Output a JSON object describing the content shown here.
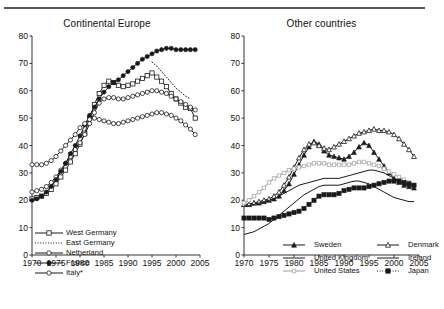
{
  "figure": {
    "panels": [
      {
        "id": "continental-europe",
        "title": "Continental Europe"
      },
      {
        "id": "other-countries",
        "title": "Other countries"
      }
    ]
  },
  "axes": {
    "y_ticks": [
      0,
      10,
      20,
      30,
      40,
      50,
      60,
      70,
      80
    ],
    "x_ticks": [
      1970,
      1975,
      1980,
      1985,
      1990,
      1995,
      2000,
      2005
    ],
    "ylim": [
      0,
      80
    ],
    "xlim": [
      1970,
      2005
    ],
    "grid": false
  },
  "legend_left": {
    "items": [
      {
        "label": "West Germany",
        "marker": "open-square",
        "style": "solid"
      },
      {
        "label": "East Germany",
        "marker": "none",
        "style": "dotted"
      },
      {
        "label": "Netherland",
        "marker": "open-circle",
        "style": "solid"
      },
      {
        "label": "France",
        "marker": "filled-circle",
        "style": "solid"
      },
      {
        "label": "Italy*",
        "marker": "open-circle",
        "style": "solid"
      }
    ]
  },
  "legend_right": {
    "items": [
      {
        "label": "Sweden",
        "marker": "filled-triangle",
        "style": "solid"
      },
      {
        "label": "Denmark",
        "marker": "open-triangle",
        "style": "solid"
      },
      {
        "label": "United Kingdom",
        "marker": "none",
        "style": "solid"
      },
      {
        "label": "Ireland",
        "marker": "none",
        "style": "solid"
      },
      {
        "label": "United States",
        "marker": "open-square-gray",
        "style": "solid-gray"
      },
      {
        "label": "Japan",
        "marker": "filled-square",
        "style": "dotted"
      }
    ]
  },
  "colors": {
    "line": "#1a1a1a",
    "gray_line": "#b3b3b3",
    "axis": "#333333",
    "background": "#ffffff"
  },
  "chart_data": [
    {
      "type": "line",
      "title": "Continental Europe",
      "xlabel": "",
      "ylabel": "",
      "xlim": [
        1970,
        2005
      ],
      "ylim": [
        0,
        80
      ],
      "x": [
        1970,
        1971,
        1972,
        1973,
        1974,
        1975,
        1976,
        1977,
        1978,
        1979,
        1980,
        1981,
        1982,
        1983,
        1984,
        1985,
        1986,
        1987,
        1988,
        1989,
        1990,
        1991,
        1992,
        1993,
        1994,
        1995,
        1996,
        1997,
        1998,
        1999,
        2000,
        2001,
        2002,
        2003,
        2004
      ],
      "series": [
        {
          "name": "West Germany",
          "marker": "open-square",
          "values": [
            20.5,
            21.0,
            21.5,
            22.5,
            24.0,
            26.0,
            28.5,
            31.0,
            34.0,
            37.0,
            40.5,
            44.5,
            50.0,
            55.0,
            59.0,
            62.0,
            63.5,
            63.0,
            62.0,
            61.5,
            62.0,
            62.5,
            63.5,
            64.5,
            65.5,
            66.5,
            65.0,
            63.5,
            61.5,
            59.0,
            57.0,
            55.5,
            54.0,
            53.5,
            50.0
          ]
        },
        {
          "name": "East Germany",
          "marker": "none",
          "style": "dotted",
          "x": [
            1995,
            1996,
            1997,
            1998,
            1999,
            2000,
            2001,
            2002,
            2003
          ],
          "values": [
            70.5,
            69.0,
            67.0,
            65.0,
            63.0,
            61.0,
            59.5,
            58.0,
            57.0
          ]
        },
        {
          "name": "Netherland",
          "marker": "open-circle",
          "values": [
            23.0,
            23.5,
            24.0,
            25.0,
            26.5,
            28.5,
            31.0,
            33.5,
            36.0,
            38.5,
            41.0,
            44.0,
            48.0,
            52.0,
            55.5,
            57.0,
            57.5,
            57.5,
            57.0,
            57.0,
            57.5,
            58.0,
            58.5,
            59.0,
            59.5,
            60.0,
            60.0,
            59.5,
            59.0,
            58.0,
            57.0,
            56.0,
            55.0,
            54.0,
            53.0
          ]
        },
        {
          "name": "France",
          "marker": "filled-circle",
          "values": [
            20.0,
            20.5,
            21.5,
            23.0,
            25.0,
            27.5,
            30.5,
            33.5,
            37.0,
            40.0,
            43.5,
            47.5,
            51.0,
            54.0,
            57.0,
            59.5,
            61.5,
            63.0,
            64.0,
            65.5,
            67.0,
            68.5,
            70.0,
            71.5,
            72.5,
            73.5,
            74.5,
            75.0,
            75.5,
            75.5,
            75.0,
            75.0,
            75.0,
            75.0,
            75.0
          ]
        },
        {
          "name": "Italy*",
          "marker": "open-circle",
          "values": [
            33.0,
            33.0,
            33.0,
            33.5,
            34.5,
            36.0,
            38.0,
            40.0,
            42.0,
            44.0,
            46.5,
            48.0,
            49.5,
            50.0,
            49.5,
            49.0,
            48.5,
            48.0,
            48.0,
            48.5,
            49.0,
            49.5,
            50.0,
            50.5,
            51.0,
            51.5,
            52.0,
            52.0,
            51.5,
            51.0,
            50.0,
            49.0,
            47.5,
            46.0,
            44.0
          ]
        }
      ]
    },
    {
      "type": "line",
      "title": "Other countries",
      "xlabel": "",
      "ylabel": "",
      "xlim": [
        1970,
        2005
      ],
      "ylim": [
        0,
        80
      ],
      "x": [
        1970,
        1971,
        1972,
        1973,
        1974,
        1975,
        1976,
        1977,
        1978,
        1979,
        1980,
        1981,
        1982,
        1983,
        1984,
        1985,
        1986,
        1987,
        1988,
        1989,
        1990,
        1991,
        1992,
        1993,
        1994,
        1995,
        1996,
        1997,
        1998,
        1999,
        2000,
        2001,
        2002,
        2003,
        2004
      ],
      "series": [
        {
          "name": "Sweden",
          "marker": "filled-triangle",
          "values": [
            18.5,
            18.5,
            19.0,
            19.0,
            19.5,
            20.0,
            20.5,
            21.5,
            23.5,
            26.0,
            29.5,
            33.0,
            36.5,
            39.5,
            41.5,
            40.5,
            38.0,
            36.5,
            36.0,
            35.5,
            35.0,
            36.0,
            37.5,
            39.5,
            41.0,
            40.0,
            37.5,
            35.0,
            32.5,
            30.0,
            28.0,
            26.5,
            25.5,
            25.0,
            24.5
          ]
        },
        {
          "name": "Denmark",
          "marker": "open-triangle",
          "values": [
            18.5,
            18.5,
            19.0,
            19.5,
            20.0,
            20.5,
            21.5,
            23.0,
            25.5,
            28.5,
            32.0,
            35.5,
            38.5,
            40.5,
            41.0,
            40.0,
            39.0,
            38.5,
            39.5,
            40.5,
            41.5,
            42.5,
            43.5,
            44.5,
            45.0,
            45.5,
            46.0,
            45.5,
            45.5,
            45.0,
            44.0,
            42.5,
            40.5,
            38.5,
            36.0
          ]
        },
        {
          "name": "United Kingdom",
          "marker": "none",
          "values": [
            18.0,
            18.0,
            18.5,
            19.0,
            19.5,
            20.0,
            20.5,
            21.5,
            22.5,
            23.5,
            24.5,
            25.5,
            26.0,
            26.5,
            27.0,
            27.5,
            28.0,
            28.0,
            28.0,
            28.0,
            28.5,
            29.0,
            29.5,
            30.0,
            30.5,
            31.0,
            31.0,
            30.5,
            30.0,
            29.0,
            28.0,
            27.0,
            26.0,
            25.5,
            25.0
          ]
        },
        {
          "name": "Ireland",
          "marker": "none",
          "values": [
            7.5,
            8.0,
            8.5,
            9.5,
            10.5,
            11.5,
            13.0,
            14.5,
            16.0,
            17.5,
            19.0,
            20.5,
            22.0,
            23.0,
            24.0,
            25.0,
            25.5,
            25.5,
            25.5,
            25.5,
            26.0,
            26.5,
            27.0,
            27.0,
            26.5,
            26.0,
            25.0,
            24.0,
            23.0,
            22.0,
            21.0,
            20.5,
            20.0,
            19.5,
            19.5
          ]
        },
        {
          "name": "United States",
          "marker": "open-square-gray",
          "values": [
            19.0,
            20.0,
            21.5,
            23.0,
            24.5,
            26.5,
            28.0,
            29.0,
            30.0,
            31.0,
            31.5,
            32.0,
            32.5,
            33.0,
            33.5,
            33.5,
            33.5,
            33.0,
            33.0,
            33.0,
            33.0,
            33.0,
            33.5,
            34.0,
            34.0,
            33.5,
            33.0,
            32.5,
            31.5,
            30.5,
            29.5,
            28.5,
            27.5,
            26.5,
            25.5
          ]
        },
        {
          "name": "Japan",
          "marker": "filled-square",
          "style": "dotted",
          "values": [
            13.5,
            13.5,
            13.5,
            13.5,
            13.5,
            13.0,
            13.5,
            14.0,
            14.5,
            15.0,
            15.5,
            16.0,
            17.0,
            18.5,
            20.0,
            21.5,
            22.0,
            22.0,
            22.0,
            22.5,
            23.5,
            24.0,
            24.5,
            24.5,
            24.5,
            25.0,
            25.5,
            26.0,
            26.5,
            27.0,
            27.0,
            27.0,
            26.5,
            26.0,
            25.5
          ]
        }
      ]
    }
  ]
}
